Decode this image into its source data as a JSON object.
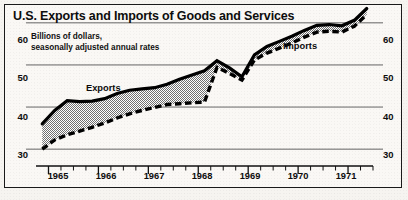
{
  "chart_data": {
    "type": "area",
    "title": "U.S. Exports and Imports of Goods and Services",
    "subtitle": "Billions of dollars,\nseasonally adjusted annual rates",
    "xlabel": "",
    "ylabel": "",
    "ylim": [
      26,
      64
    ],
    "xlim": [
      1964.75,
      1971.5
    ],
    "grid": true,
    "gridlines": [
      30,
      40,
      50,
      60
    ],
    "legend_position": "inline-on-curve",
    "y_ticks_left": [
      "60",
      "50",
      "40",
      "30"
    ],
    "y_ticks_right": [
      "60",
      "50",
      "40",
      "30"
    ],
    "x_tick_labels": [
      "1965",
      "1966",
      "1967",
      "1968",
      "1969",
      "1970",
      "1971"
    ],
    "x_minor_ticks_per_year": 4,
    "x": [
      1964.875,
      1965.125,
      1965.375,
      1965.625,
      1965.875,
      1966.125,
      1966.375,
      1966.625,
      1966.875,
      1967.125,
      1967.375,
      1967.625,
      1967.875,
      1968.125,
      1968.375,
      1968.625,
      1968.875,
      1969.125,
      1969.375,
      1969.625,
      1969.875,
      1970.125,
      1970.375,
      1970.625,
      1970.875,
      1971.125,
      1971.375
    ],
    "series": [
      {
        "name": "Exports",
        "style": "solid",
        "color": "#000000",
        "values": [
          36.0,
          39.2,
          41.5,
          41.3,
          41.4,
          42.0,
          43.2,
          44.0,
          44.3,
          44.6,
          45.4,
          46.6,
          47.6,
          48.6,
          51.0,
          49.3,
          47.2,
          52.4,
          54.4,
          55.6,
          56.8,
          58.2,
          59.4,
          59.6,
          59.3,
          60.6,
          63.4
        ]
      },
      {
        "name": "Imports",
        "style": "dashed",
        "color": "#000000",
        "values": [
          30.0,
          32.2,
          33.4,
          34.3,
          35.2,
          36.2,
          37.4,
          38.4,
          39.2,
          39.9,
          40.6,
          40.8,
          41.0,
          41.2,
          49.4,
          48.0,
          46.4,
          51.2,
          52.8,
          54.0,
          55.2,
          56.6,
          57.8,
          58.0,
          57.8,
          59.2,
          62.0
        ]
      }
    ],
    "fill_between": {
      "label": "gap between exports and imports",
      "pattern": "checkerboard-dither",
      "color": "#9a9a9a"
    },
    "annotations": [
      {
        "text": "Exports",
        "series": "Exports"
      },
      {
        "text": "Imports",
        "series": "Imports"
      }
    ]
  }
}
